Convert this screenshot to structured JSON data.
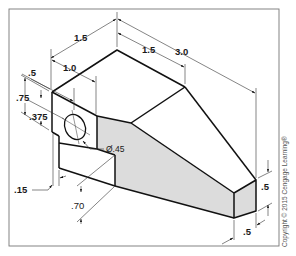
{
  "figure": {
    "type": "isometric-dimensioned-drawing",
    "colors": {
      "line": "#111111",
      "dimension_line": "#333333",
      "shaded_face": "#dcdcdc",
      "border": "#777777",
      "background": "#ffffff"
    },
    "dimensions": {
      "overall_depth": "1.5",
      "top_length": "1.5",
      "overall_length": "3.0",
      "block_width": "1.0",
      "hole_offset_x": ".5",
      "block_height": ".75",
      "hole_offset_y": ".375",
      "hole_diameter": "Ø.45",
      "step_offset": ".15",
      "lower_height": ".70",
      "end_height": ".5",
      "end_width": ".5"
    },
    "copyright": "Copyright © 2015 Cengage Learning®"
  }
}
